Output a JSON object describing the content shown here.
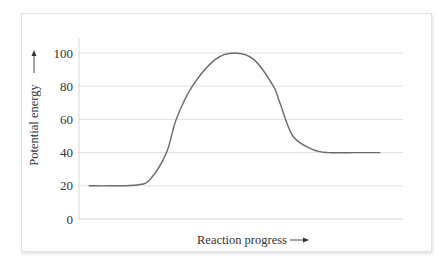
{
  "chart_data": {
    "type": "line",
    "title": "",
    "xlabel": "Reaction progress",
    "ylabel": "Potential energy",
    "xlabel_arrow": "→",
    "ylabel_arrow": "↑",
    "ylim": [
      0,
      100
    ],
    "yticks": [
      0,
      20,
      40,
      60,
      80,
      100
    ],
    "ytick_labels": [
      "0",
      "20",
      "40",
      "60",
      "80",
      "100"
    ],
    "xticks": [],
    "grid": true,
    "legend": null,
    "series": [
      {
        "name": "Potential energy",
        "color": "#6b6b6b",
        "x": [
          3,
          10,
          18,
          22,
          27,
          30,
          35,
          42,
          48,
          54,
          60,
          62,
          66,
          72,
          77,
          85,
          93
        ],
        "y": [
          20,
          20,
          20.5,
          24,
          40,
          60,
          80,
          96,
          100,
          96,
          80,
          70,
          50,
          42,
          40,
          40,
          40
        ]
      }
    ]
  },
  "labels": {
    "x_title": "Reaction progress",
    "y_title": "Potential energy"
  }
}
